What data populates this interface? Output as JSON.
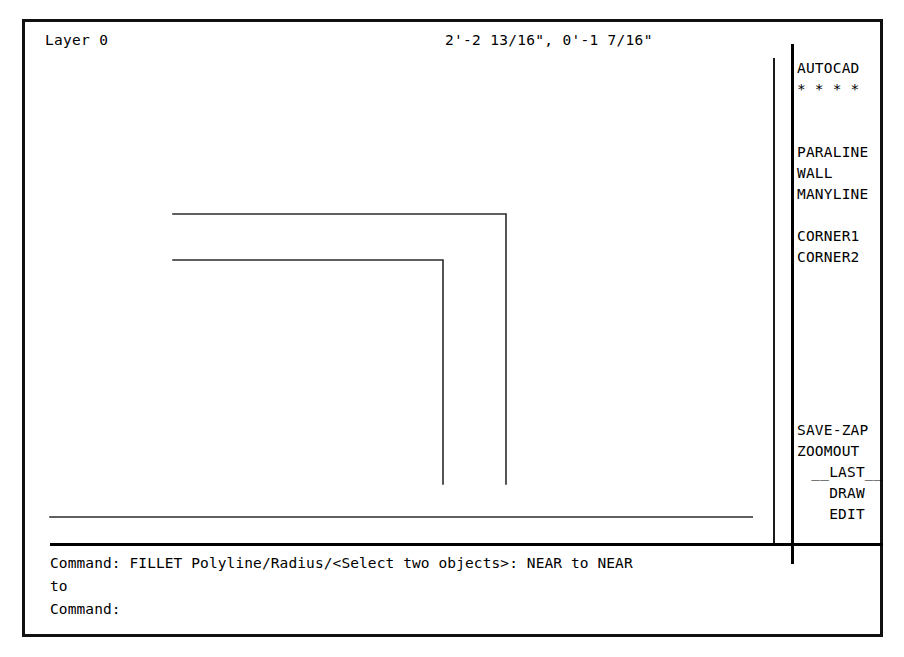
{
  "app": {
    "name": "AutoCAD",
    "frame_color": "#111111",
    "ink_color": "#000000",
    "background_color": "#ffffff"
  },
  "status_bar": {
    "layer_label": "Layer 0",
    "coordinates": "2'-2 13/16\", 0'-1 7/16\""
  },
  "side_menu": {
    "header": {
      "title": "AUTOCAD",
      "separator": "* * * *"
    },
    "groups": [
      {
        "name": "draw-tools",
        "items": [
          {
            "label": "PARALINE"
          },
          {
            "label": "WALL"
          },
          {
            "label": "MANYLINE"
          }
        ]
      },
      {
        "name": "corner-tools",
        "items": [
          {
            "label": "CORNER1"
          },
          {
            "label": "CORNER2"
          }
        ]
      },
      {
        "name": "utility-tools",
        "items": [
          {
            "label": "SAVE-ZAP",
            "centered": false
          },
          {
            "label": "ZOOMOUT",
            "centered": false
          },
          {
            "label": "__LAST__",
            "centered": true
          },
          {
            "label": "DRAW",
            "centered": true
          },
          {
            "label": "EDIT",
            "centered": true
          }
        ]
      }
    ]
  },
  "command_area": {
    "lines": [
      "Command: FILLET Polyline/Radius/<Select two objects>: NEAR to NEAR",
      "to",
      "Command:"
    ]
  },
  "drawing": {
    "description": "Two-dimensional wall plan drawn as polylines with filleted corners",
    "stroke_color": "#2b2b2b",
    "stroke_width": 1.6,
    "polylines": [
      {
        "name": "outer-wall-line",
        "points": "145,189 478,189 478,459"
      },
      {
        "name": "inner-wall-line",
        "points": "145,235 415,235 415,459"
      },
      {
        "name": "bottom-wall-line-upper",
        "points": "22,513 748,513"
      },
      {
        "name": "bottom-wall-line-lower",
        "points": "22,535 748,535"
      }
    ]
  }
}
